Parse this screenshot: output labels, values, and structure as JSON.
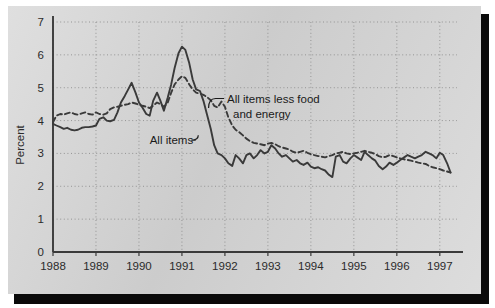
{
  "chart_data": {
    "type": "line",
    "title": "",
    "xlabel": "",
    "ylabel": "Percent",
    "xlim": [
      1988,
      1997.4
    ],
    "ylim": [
      0,
      7
    ],
    "yticks": [
      0,
      1,
      2,
      3,
      4,
      5,
      6,
      7
    ],
    "ytick_labels": [
      "0",
      "1",
      "2",
      "3",
      "4",
      "5",
      "6",
      "7"
    ],
    "xticks": [
      1988,
      1989,
      1990,
      1991,
      1992,
      1993,
      1994,
      1995,
      1996,
      1997
    ],
    "xtick_labels": [
      "1988",
      "1989",
      "1990",
      "1991",
      "1992",
      "1993",
      "1994",
      "1995",
      "1996",
      "1997"
    ],
    "grid": "dotted both axes",
    "legend_position": "inline annotations",
    "annotations": [
      {
        "name": "all-items-less-food-and-energy",
        "text_line1": "All items less food",
        "text_line2": "and energy",
        "x": 1992.05,
        "y": 4.55,
        "leader_to": [
          1991.62,
          4.38
        ]
      },
      {
        "name": "all-items",
        "text_line1": "All items",
        "text_line2": "",
        "x": 1990.25,
        "y": 3.28,
        "leader_to": [
          1991.38,
          3.55
        ]
      }
    ],
    "series": [
      {
        "name": "All items",
        "style": "solid",
        "color": "#3a3a3a",
        "x": [
          1988.0,
          1988.08,
          1988.17,
          1988.25,
          1988.33,
          1988.42,
          1988.5,
          1988.58,
          1988.67,
          1988.75,
          1988.83,
          1988.92,
          1989.0,
          1989.08,
          1989.17,
          1989.25,
          1989.33,
          1989.42,
          1989.5,
          1989.58,
          1989.67,
          1989.75,
          1989.83,
          1989.92,
          1990.0,
          1990.08,
          1990.17,
          1990.25,
          1990.33,
          1990.42,
          1990.5,
          1990.58,
          1990.67,
          1990.75,
          1990.83,
          1990.92,
          1991.0,
          1991.08,
          1991.17,
          1991.25,
          1991.33,
          1991.42,
          1991.5,
          1991.58,
          1991.67,
          1991.75,
          1991.83,
          1991.92,
          1992.0,
          1992.08,
          1992.17,
          1992.25,
          1992.33,
          1992.42,
          1992.5,
          1992.58,
          1992.67,
          1992.75,
          1992.83,
          1992.92,
          1993.0,
          1993.08,
          1993.17,
          1993.25,
          1993.33,
          1993.42,
          1993.5,
          1993.58,
          1993.67,
          1993.75,
          1993.83,
          1993.92,
          1994.0,
          1994.08,
          1994.17,
          1994.25,
          1994.33,
          1994.42,
          1994.5,
          1994.58,
          1994.67,
          1994.75,
          1994.83,
          1994.92,
          1995.0,
          1995.08,
          1995.17,
          1995.25,
          1995.33,
          1995.42,
          1995.5,
          1995.58,
          1995.67,
          1995.75,
          1995.83,
          1995.92,
          1996.0,
          1996.08,
          1996.17,
          1996.25,
          1996.33,
          1996.42,
          1996.5,
          1996.58,
          1996.67,
          1996.75,
          1996.83,
          1996.92,
          1997.0,
          1997.08,
          1997.17,
          1997.25
        ],
        "values": [
          3.9,
          3.85,
          3.8,
          3.75,
          3.78,
          3.72,
          3.7,
          3.72,
          3.78,
          3.8,
          3.8,
          3.82,
          3.85,
          4.05,
          4.1,
          4.0,
          3.98,
          4.02,
          4.25,
          4.55,
          4.75,
          4.95,
          5.15,
          4.85,
          4.55,
          4.4,
          4.2,
          4.15,
          4.6,
          4.85,
          4.6,
          4.3,
          4.7,
          5.1,
          5.6,
          6.05,
          6.25,
          6.15,
          5.75,
          5.25,
          4.95,
          4.9,
          4.6,
          4.2,
          3.75,
          3.25,
          3.0,
          2.95,
          2.85,
          2.7,
          2.62,
          2.95,
          2.85,
          2.7,
          2.95,
          3.0,
          2.85,
          2.95,
          3.1,
          3.0,
          3.05,
          3.25,
          3.15,
          3.0,
          2.9,
          2.95,
          2.85,
          2.75,
          2.8,
          2.7,
          2.65,
          2.72,
          2.6,
          2.55,
          2.58,
          2.52,
          2.48,
          2.35,
          2.28,
          2.9,
          2.95,
          2.75,
          2.7,
          2.85,
          2.95,
          2.88,
          2.8,
          3.05,
          2.95,
          2.85,
          2.78,
          2.62,
          2.52,
          2.6,
          2.72,
          2.65,
          2.72,
          2.8,
          2.88,
          2.95,
          2.9,
          2.85,
          2.9,
          2.95,
          3.05,
          3.0,
          2.95,
          2.85,
          3.02,
          2.95,
          2.7,
          2.42
        ]
      },
      {
        "name": "All items less food and energy",
        "style": "dashed",
        "color": "#3a3a3a",
        "x": [
          1988.0,
          1988.08,
          1988.17,
          1988.25,
          1988.33,
          1988.42,
          1988.5,
          1988.58,
          1988.67,
          1988.75,
          1988.83,
          1988.92,
          1989.0,
          1989.08,
          1989.17,
          1989.25,
          1989.33,
          1989.42,
          1989.5,
          1989.58,
          1989.67,
          1989.75,
          1989.83,
          1989.92,
          1990.0,
          1990.08,
          1990.17,
          1990.25,
          1990.33,
          1990.42,
          1990.5,
          1990.58,
          1990.67,
          1990.75,
          1990.83,
          1990.92,
          1991.0,
          1991.08,
          1991.17,
          1991.25,
          1991.33,
          1991.42,
          1991.5,
          1991.58,
          1991.67,
          1991.75,
          1991.83,
          1991.92,
          1992.0,
          1992.08,
          1992.17,
          1992.25,
          1992.33,
          1992.42,
          1992.5,
          1992.58,
          1992.67,
          1992.75,
          1992.83,
          1992.92,
          1993.0,
          1993.08,
          1993.17,
          1993.25,
          1993.33,
          1993.42,
          1993.5,
          1993.58,
          1993.67,
          1993.75,
          1993.83,
          1993.92,
          1994.0,
          1994.08,
          1994.17,
          1994.25,
          1994.33,
          1994.42,
          1994.5,
          1994.58,
          1994.67,
          1994.75,
          1994.83,
          1994.92,
          1995.0,
          1995.08,
          1995.17,
          1995.25,
          1995.33,
          1995.42,
          1995.5,
          1995.58,
          1995.67,
          1995.75,
          1995.83,
          1995.92,
          1996.0,
          1996.08,
          1996.17,
          1996.25,
          1996.33,
          1996.42,
          1996.5,
          1996.58,
          1996.67,
          1996.75,
          1996.83,
          1996.92,
          1997.0,
          1997.08,
          1997.17,
          1997.25
        ],
        "values": [
          3.95,
          4.15,
          4.2,
          4.18,
          4.22,
          4.25,
          4.2,
          4.18,
          4.22,
          4.25,
          4.2,
          4.18,
          4.25,
          4.2,
          4.18,
          4.22,
          4.35,
          4.4,
          4.42,
          4.45,
          4.48,
          4.5,
          4.55,
          4.52,
          4.48,
          4.45,
          4.42,
          4.38,
          4.45,
          4.55,
          4.5,
          4.42,
          4.55,
          4.85,
          5.1,
          5.25,
          5.35,
          5.3,
          5.1,
          4.95,
          4.85,
          4.82,
          4.78,
          4.72,
          4.62,
          4.45,
          4.4,
          4.58,
          4.42,
          4.1,
          3.85,
          3.72,
          3.65,
          3.55,
          3.45,
          3.38,
          3.32,
          3.3,
          3.28,
          3.25,
          3.3,
          3.32,
          3.28,
          3.22,
          3.18,
          3.15,
          3.12,
          3.05,
          3.02,
          3.05,
          3.08,
          3.02,
          2.98,
          2.95,
          2.92,
          2.9,
          2.88,
          2.92,
          2.95,
          3.0,
          3.02,
          3.05,
          3.0,
          2.98,
          3.0,
          3.02,
          3.05,
          3.08,
          3.05,
          3.02,
          2.98,
          2.92,
          2.88,
          2.9,
          2.95,
          2.92,
          2.88,
          2.85,
          2.82,
          2.8,
          2.78,
          2.75,
          2.72,
          2.7,
          2.68,
          2.62,
          2.58,
          2.55,
          2.52,
          2.48,
          2.45,
          2.42
        ]
      }
    ]
  },
  "colors": {
    "panel_background": "#d7d7d7",
    "ink": "#3a3a3a",
    "shadow": "#0a0a0a",
    "page_background": "#ffffff"
  }
}
